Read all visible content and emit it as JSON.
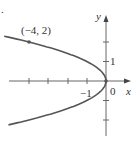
{
  "figure": {
    "marker": ".",
    "point_label": "(−4, 2)",
    "x_axis_label": "x",
    "y_axis_label": "y",
    "origin_label": "0",
    "x_tick_label": "−1",
    "y_tick_label": "1",
    "curve_color": "#555555",
    "axis_color": "#666666"
  },
  "chart_data": {
    "type": "line",
    "title": "",
    "equation": "x = -y^2",
    "xlabel": "x",
    "ylabel": "y",
    "xlim": [
      -5,
      1
    ],
    "ylim": [
      -3,
      3
    ],
    "x_ticks": [
      -4,
      -3,
      -2,
      -1,
      0
    ],
    "y_ticks": [
      -2,
      -1,
      1,
      2
    ],
    "tick_labels": {
      "x": [
        "−1",
        "0"
      ],
      "y": [
        "1"
      ]
    },
    "highlighted_point": {
      "x": -4,
      "y": 2,
      "label": "(−4, 2)"
    },
    "vertex": {
      "x": 0,
      "y": 0
    }
  }
}
